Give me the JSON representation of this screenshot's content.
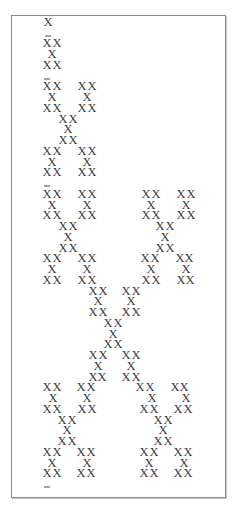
{
  "figure": {
    "glyph": "X",
    "separator": "_",
    "row_pitch_px": 10.745,
    "first_row_y": 22,
    "rows": [
      {
        "type": "x",
        "xs": [
          48
        ]
      },
      {
        "type": "dash",
        "xs": [
          48
        ]
      },
      {
        "type": "x",
        "xs": [
          47,
          57
        ]
      },
      {
        "type": "x",
        "xs": [
          52
        ]
      },
      {
        "type": "x",
        "xs": [
          47,
          57
        ]
      },
      {
        "type": "dash",
        "xs": [
          47
        ]
      },
      {
        "type": "x",
        "xs": [
          47,
          57,
          82,
          92
        ]
      },
      {
        "type": "x",
        "xs": [
          52,
          87
        ]
      },
      {
        "type": "x",
        "xs": [
          47,
          57,
          82,
          92
        ]
      },
      {
        "type": "x",
        "xs": [
          63,
          73
        ]
      },
      {
        "type": "x",
        "xs": [
          68
        ]
      },
      {
        "type": "x",
        "xs": [
          63,
          73
        ]
      },
      {
        "type": "x",
        "xs": [
          47,
          57,
          82,
          92
        ]
      },
      {
        "type": "x",
        "xs": [
          52,
          87
        ]
      },
      {
        "type": "x",
        "xs": [
          47,
          57,
          82,
          92
        ]
      },
      {
        "type": "dash",
        "xs": [
          47
        ]
      },
      {
        "type": "x",
        "xs": [
          47,
          57,
          82,
          92,
          146,
          156,
          181,
          191
        ]
      },
      {
        "type": "x",
        "xs": [
          52,
          87,
          151,
          186
        ]
      },
      {
        "type": "x",
        "xs": [
          47,
          57,
          82,
          92,
          146,
          156,
          181,
          191
        ]
      },
      {
        "type": "x",
        "xs": [
          63,
          73,
          160,
          170
        ]
      },
      {
        "type": "x",
        "xs": [
          68,
          165
        ]
      },
      {
        "type": "x",
        "xs": [
          63,
          73,
          160,
          170
        ]
      },
      {
        "type": "x",
        "xs": [
          47,
          57,
          82,
          92,
          145,
          155,
          180,
          189
        ]
      },
      {
        "type": "x",
        "xs": [
          52,
          87,
          151,
          186
        ]
      },
      {
        "type": "x",
        "xs": [
          47,
          57,
          82,
          92,
          146,
          156,
          181,
          190
        ]
      },
      {
        "type": "x",
        "xs": [
          93,
          103,
          126,
          136
        ]
      },
      {
        "type": "x",
        "xs": [
          98,
          131
        ]
      },
      {
        "type": "x",
        "xs": [
          93,
          103,
          126,
          136
        ]
      },
      {
        "type": "x",
        "xs": [
          108,
          118
        ]
      },
      {
        "type": "x",
        "xs": [
          113
        ]
      },
      {
        "type": "x",
        "xs": [
          108,
          118
        ]
      },
      {
        "type": "x",
        "xs": [
          93,
          103,
          126,
          136
        ]
      },
      {
        "type": "x",
        "xs": [
          98,
          131
        ]
      },
      {
        "type": "x",
        "xs": [
          93,
          102,
          126,
          136
        ]
      },
      {
        "type": "x",
        "xs": [
          47,
          57,
          81,
          91,
          140,
          150,
          175,
          184
        ]
      },
      {
        "type": "x",
        "xs": [
          53,
          87,
          152,
          186
        ]
      },
      {
        "type": "x",
        "xs": [
          47,
          57,
          82,
          92,
          144,
          154,
          178,
          188
        ]
      },
      {
        "type": "x",
        "xs": [
          62,
          72,
          158,
          168
        ]
      },
      {
        "type": "x",
        "xs": [
          67,
          163
        ]
      },
      {
        "type": "x",
        "xs": [
          62,
          72,
          158,
          168
        ]
      },
      {
        "type": "x",
        "xs": [
          47,
          57,
          81,
          91,
          144,
          154,
          178,
          188
        ]
      },
      {
        "type": "x",
        "xs": [
          52,
          87,
          149,
          184
        ]
      },
      {
        "type": "x",
        "xs": [
          47,
          57,
          81,
          91,
          144,
          154,
          178,
          188
        ]
      },
      {
        "type": "dash",
        "xs": [
          47
        ]
      }
    ]
  }
}
